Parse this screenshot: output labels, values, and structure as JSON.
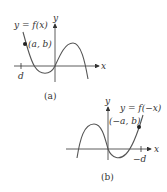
{
  "figure_a": {
    "caption": "(a)",
    "function_label": "y = f(x)",
    "point_label": "(a, b)",
    "x_axis_label": "x",
    "y_axis_label": "y",
    "tick_label": "d"
  },
  "figure_b": {
    "caption": "(b)",
    "function_label": "y = f(−x)",
    "point_label": "(−a, b)",
    "x_axis_label": "x",
    "y_axis_label": "y",
    "tick_label": "−d"
  },
  "colors": {
    "curve": "#555555",
    "axis": "#333333",
    "text": "#333333"
  }
}
